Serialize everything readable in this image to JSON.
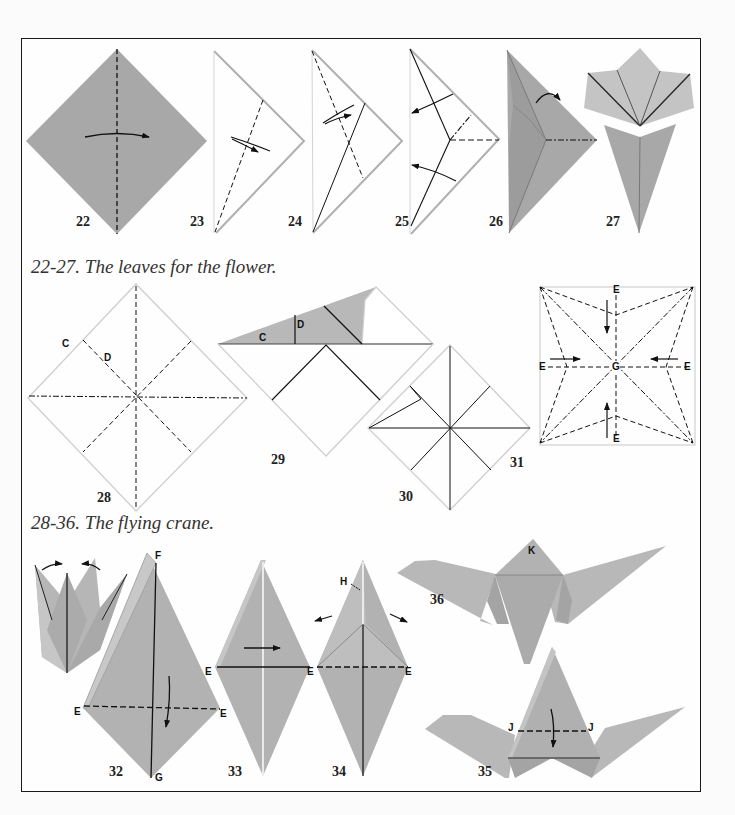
{
  "colors": {
    "paper_dark": "#a8a8a8",
    "paper_mid": "#b4b4b4",
    "paper_light": "#c4c4c4",
    "edge": "#8e8e8e",
    "outline_light": "#c8c8c8",
    "line": "#111111",
    "frame": "#1a1a1a"
  },
  "captions": {
    "leaves": "22-27. The leaves for the flower.",
    "crane": "28-36. The flying crane."
  },
  "step_numbers": {
    "s22": "22",
    "s23": "23",
    "s24": "24",
    "s25": "25",
    "s26": "26",
    "s27": "27",
    "s28": "28",
    "s29": "29",
    "s30": "30",
    "s31": "31",
    "s32": "32",
    "s33": "33",
    "s34": "34",
    "s35": "35",
    "s36": "36"
  },
  "point_labels": {
    "s28_c": "C",
    "s28_d": "D",
    "s29_c": "C",
    "s29_d": "D",
    "s31_e_top": "E",
    "s31_e_left": "E",
    "s31_e_right": "E",
    "s31_e_bottom": "E",
    "s31_g": "G",
    "s32_f": "F",
    "s32_e_left": "E",
    "s32_e_right": "E",
    "s32_g": "G",
    "s33_e_left": "E",
    "s33_e_right": "E",
    "s34_h": "H",
    "s34_e_left": "E",
    "s34_e_right": "E",
    "s35_j_left": "J",
    "s35_j_right": "J",
    "s36_k": "K"
  }
}
